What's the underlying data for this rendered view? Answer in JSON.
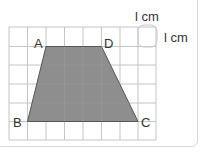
{
  "figure": {
    "type": "trapezoid-on-grid",
    "grid": {
      "columns": 8,
      "rows": 6,
      "cell_label_horizontal": "l cm",
      "cell_label_vertical": "l cm"
    },
    "vertices": {
      "A": {
        "label": "A",
        "col": 2,
        "row": 1
      },
      "D": {
        "label": "D",
        "col": 5,
        "row": 1
      },
      "B": {
        "label": "B",
        "col": 1,
        "row": 5
      },
      "C": {
        "label": "C",
        "col": 7,
        "row": 5
      }
    },
    "colors": {
      "fill": "#8c8c8c",
      "grid": "#bdbdbd",
      "outline": "#555555",
      "highlight": "#c8c8c8"
    }
  }
}
